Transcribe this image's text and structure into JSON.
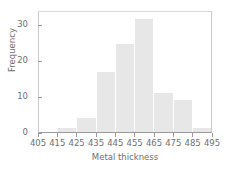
{
  "chart_data": {
    "type": "bar",
    "title": "",
    "xlabel": "Metal thickness",
    "ylabel": "Frequency",
    "categories": [
      "405-415",
      "415-425",
      "425-435",
      "435-445",
      "445-455",
      "455-465",
      "465-475",
      "475-485",
      "485-495"
    ],
    "bin_edges": [
      405,
      415,
      425,
      435,
      445,
      455,
      465,
      475,
      485,
      495
    ],
    "values": [
      0,
      1,
      4,
      17,
      25,
      32,
      11,
      9,
      1
    ],
    "xtick_labels": [
      "405",
      "415",
      "425",
      "435",
      "445",
      "455",
      "465",
      "475",
      "485",
      "495"
    ],
    "ytick_labels": [
      "0",
      "10",
      "20",
      "30"
    ],
    "ytick_values": [
      0,
      10,
      20,
      30
    ],
    "xlim": [
      405,
      495
    ],
    "ylim": [
      0,
      34
    ],
    "grid": false,
    "legend": false,
    "bar_color": "#e7e7e7",
    "axis_color": "#9a9a9a",
    "text_color": "#6f6f6f"
  }
}
